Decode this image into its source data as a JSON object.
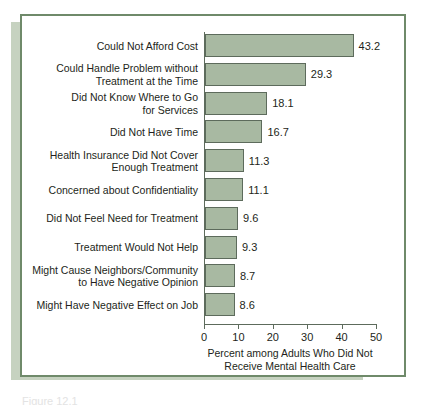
{
  "figure": {
    "frame_color": "#6f8a6a",
    "shadow_color": "#c3d0bd",
    "bar_fill": "#a8b9a2",
    "bar_stroke": "#5d6b5c",
    "axis_color": "#5d6b5c",
    "text_color": "#231f20",
    "caption_partial": "Figure 12.1"
  },
  "chart_data": {
    "type": "bar",
    "orientation": "horizontal",
    "title": "",
    "subtitle": "",
    "xlabel": "Percent among Adults Who Did Not\nReceive Mental Health Care",
    "ylabel": "",
    "xlim": [
      0,
      50
    ],
    "xticks": [
      0,
      10,
      20,
      30,
      40,
      50
    ],
    "xtick_labels": [
      "0",
      "10",
      "20",
      "30",
      "40",
      "50"
    ],
    "grid": false,
    "legend": null,
    "value_label_format": "one-decimal",
    "categories": [
      "Could Not Afford Cost",
      "Could Handle Problem without\nTreatment at the Time",
      "Did Not Know Where to Go\nfor Services",
      "Did Not Have Time",
      "Health Insurance Did Not Cover\nEnough Treatment",
      "Concerned about Confidentiality",
      "Did Not Feel Need for Treatment",
      "Treatment Would Not Help",
      "Might Cause Neighbors/Community\nto Have Negative Opinion",
      "Might Have Negative Effect on Job"
    ],
    "values": [
      43.2,
      29.3,
      18.1,
      16.7,
      11.3,
      11.1,
      9.6,
      9.3,
      8.7,
      8.6
    ],
    "value_labels": [
      "43.2",
      "29.3",
      "18.1",
      "16.7",
      "11.3",
      "11.1",
      "9.6",
      "9.3",
      "8.7",
      "8.6"
    ],
    "bars": [
      {
        "category": "Could Not Afford Cost",
        "value": 43.2,
        "label": "43.2"
      },
      {
        "category": "Could Handle Problem without\nTreatment at the Time",
        "value": 29.3,
        "label": "29.3"
      },
      {
        "category": "Did Not Know Where to Go\nfor Services",
        "value": 18.1,
        "label": "18.1"
      },
      {
        "category": "Did Not Have Time",
        "value": 16.7,
        "label": "16.7"
      },
      {
        "category": "Health Insurance Did Not Cover\nEnough Treatment",
        "value": 11.3,
        "label": "11.3"
      },
      {
        "category": "Concerned about Confidentiality",
        "value": 11.1,
        "label": "11.1"
      },
      {
        "category": "Did Not Feel Need for Treatment",
        "value": 9.6,
        "label": "9.6"
      },
      {
        "category": "Treatment Would Not Help",
        "value": 9.3,
        "label": "9.3"
      },
      {
        "category": "Might Cause Neighbors/Community\nto Have Negative Opinion",
        "value": 8.7,
        "label": "8.7"
      },
      {
        "category": "Might Have Negative Effect on Job",
        "value": 8.6,
        "label": "8.6"
      }
    ]
  }
}
